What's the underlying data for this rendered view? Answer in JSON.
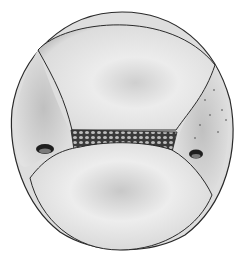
{
  "image": {
    "description": "Grayscale pencil illustration of a spherical grain with two lateral pores and a central reticulate band",
    "colors": {
      "background": "#ffffff",
      "outline": "#2a2a2a",
      "shade_dark": "#8a8a8a",
      "shade_mid": "#b5b5b5",
      "shade_light": "#e6e6e6",
      "band": "#3a3a3a"
    }
  }
}
